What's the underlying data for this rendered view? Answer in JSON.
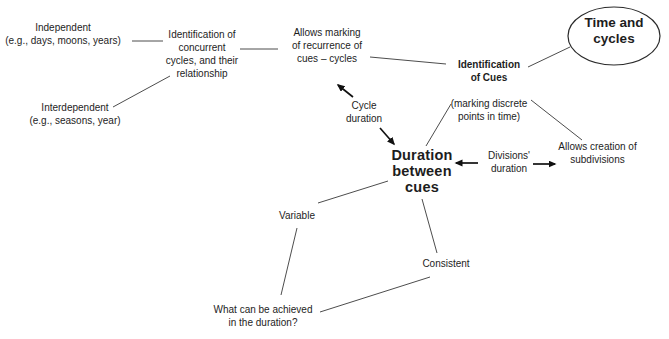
{
  "diagram": {
    "title": "Time and cycles",
    "background_color": "#ffffff",
    "text_color": "#1d1d1d",
    "line_color": "#4d4d4d",
    "arrow_color": "#111111",
    "nodes": {
      "time_cycles": {
        "label": "Time and\ncycles",
        "shape": "ellipse",
        "emphasis": "bold"
      },
      "independent": {
        "label": "Independent\n(e.g., days, moons, years)"
      },
      "interdependent": {
        "label": "Interdependent\n(e.g., seasons, year)"
      },
      "concurrent": {
        "label": "Identification of\nconcurrent\ncycles, and their\nrelationship"
      },
      "marking_recurrence": {
        "label": "Allows marking\nof recurrence of\ncues – cycles"
      },
      "identification_cues": {
        "label": "Identification\nof Cues",
        "sublabel": "(marking discrete\npoints in time)",
        "emphasis": "bold"
      },
      "cycle_duration": {
        "label": "Cycle\nduration"
      },
      "duration_between_cues": {
        "label": "Duration\nbetween\ncues",
        "emphasis": "bold"
      },
      "divisions_duration": {
        "label": "Divisions'\nduration"
      },
      "allows_subdivisions": {
        "label": "Allows creation of\nsubdivisions"
      },
      "variable": {
        "label": "Variable"
      },
      "consistent": {
        "label": "Consistent"
      },
      "what_achieved": {
        "label": "What can be achieved\nin the duration?"
      }
    },
    "edges": [
      {
        "from": "Independent",
        "to": "Identification of concurrent cycles, and their relationship",
        "type": "line"
      },
      {
        "from": "Interdependent",
        "to": "Identification of concurrent cycles, and their relationship",
        "type": "line"
      },
      {
        "from": "Identification of concurrent cycles, and their relationship",
        "to": "Allows marking of recurrence of cues – cycles",
        "type": "line"
      },
      {
        "from": "Allows marking of recurrence of cues – cycles",
        "to": "Identification of Cues",
        "type": "line"
      },
      {
        "from": "Identification of Cues",
        "to": "Time and cycles",
        "type": "line"
      },
      {
        "from": "Identification of Cues",
        "to": "Duration between cues",
        "type": "line"
      },
      {
        "from": "Identification of Cues",
        "to": "Allows creation of subdivisions",
        "type": "line"
      },
      {
        "from": "Cycle duration",
        "to": "Allows marking of recurrence of cues – cycles",
        "type": "arrow"
      },
      {
        "from": "Cycle duration",
        "to": "Duration between cues",
        "type": "arrow"
      },
      {
        "from": "Divisions' duration",
        "to": "Duration between cues",
        "type": "arrow"
      },
      {
        "from": "Divisions' duration",
        "to": "Allows creation of subdivisions",
        "type": "arrow"
      },
      {
        "from": "Duration between cues",
        "to": "Variable",
        "type": "line"
      },
      {
        "from": "Duration between cues",
        "to": "Consistent",
        "type": "line"
      },
      {
        "from": "Variable",
        "to": "What can be achieved in the duration?",
        "type": "line"
      },
      {
        "from": "Consistent",
        "to": "What can be achieved in the duration?",
        "type": "line"
      }
    ]
  }
}
